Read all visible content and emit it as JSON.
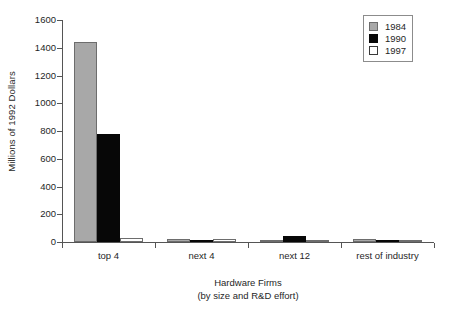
{
  "chart_data": {
    "type": "bar",
    "title": "",
    "subtitle": "",
    "xlabel": "Hardware Firms",
    "xlabel_line2": "(by size and R&D effort)",
    "ylabel": "Millions of 1992 Dollars",
    "categories": [
      "top 4",
      "next 4",
      "next 12",
      "rest of industry"
    ],
    "series": [
      {
        "name": "1984",
        "color": "#a8a8a8",
        "values": [
          1440,
          20,
          10,
          22
        ]
      },
      {
        "name": "1990",
        "color": "#070707",
        "values": [
          775,
          12,
          42,
          10
        ]
      },
      {
        "name": "1997",
        "color": "#ffffff",
        "values": [
          30,
          22,
          18,
          8
        ]
      }
    ],
    "ylim": [
      0,
      1600
    ],
    "ytick_labels": [
      "1600",
      "1400",
      "1200",
      "1000",
      "800",
      "600",
      "400",
      "200",
      "0"
    ],
    "ytick_values": [
      1600,
      1400,
      1200,
      1000,
      800,
      600,
      400,
      200,
      0
    ],
    "grid": false,
    "legend_position": "top-right",
    "legend_entries": [
      "1984",
      "1990",
      "1997"
    ]
  }
}
